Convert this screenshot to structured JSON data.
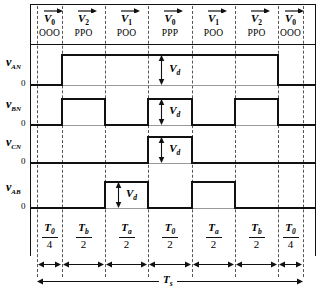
{
  "figure": {
    "zero_label": "0",
    "amplitude_label": "V",
    "amplitude_sub": "d",
    "total_label": "T",
    "total_sub": "s"
  },
  "segments": [
    {
      "vector": "V",
      "vector_sub": "0",
      "state": "OOO",
      "time_num": "T",
      "time_num_sub": "0",
      "time_den": "4"
    },
    {
      "vector": "V",
      "vector_sub": "2",
      "state": "PPO",
      "time_num": "T",
      "time_num_sub": "b",
      "time_den": "2"
    },
    {
      "vector": "V",
      "vector_sub": "1",
      "state": "POO",
      "time_num": "T",
      "time_num_sub": "a",
      "time_den": "2"
    },
    {
      "vector": "V",
      "vector_sub": "0",
      "state": "PPP",
      "time_num": "T",
      "time_num_sub": "0",
      "time_den": "2"
    },
    {
      "vector": "V",
      "vector_sub": "1",
      "state": "POO",
      "time_num": "T",
      "time_num_sub": "a",
      "time_den": "2"
    },
    {
      "vector": "V",
      "vector_sub": "2",
      "state": "PPO",
      "time_num": "T",
      "time_num_sub": "b",
      "time_den": "2"
    },
    {
      "vector": "V",
      "vector_sub": "0",
      "state": "OOO",
      "time_num": "T",
      "time_num_sub": "0",
      "time_den": "4"
    }
  ],
  "waveforms": [
    {
      "name": "v",
      "sub": "AN",
      "zero": "0",
      "levels": [
        0,
        1,
        1,
        1,
        1,
        1,
        0
      ],
      "vd_segment": 3,
      "vd_label": "V",
      "vd_sub": "d"
    },
    {
      "name": "v",
      "sub": "BN",
      "zero": "0",
      "levels": [
        0,
        1,
        0,
        1,
        0,
        1,
        0
      ],
      "vd_segment": 3,
      "vd_label": "V",
      "vd_sub": "d"
    },
    {
      "name": "v",
      "sub": "CN",
      "zero": "0",
      "levels": [
        0,
        0,
        0,
        1,
        0,
        0,
        0
      ],
      "vd_segment": 3,
      "vd_label": "V",
      "vd_sub": "d"
    },
    {
      "name": "v",
      "sub": "AB",
      "zero": "0",
      "levels": [
        0,
        0,
        1,
        0,
        1,
        0,
        0
      ],
      "vd_segment": 2,
      "vd_label": "V",
      "vd_sub": "d"
    }
  ],
  "chart_data": {
    "type": "line",
    "xlabel": "time",
    "ylabel": "pole / line voltages",
    "grid": false,
    "legend": "none",
    "x_boundaries_px": [
      37,
      62,
      105,
      148,
      192,
      235,
      278,
      303
    ],
    "categories": [
      "OOO",
      "PPO",
      "POO",
      "PPP",
      "POO",
      "PPO",
      "OOO"
    ],
    "vectors": [
      "V0",
      "V2",
      "V1",
      "V0",
      "V1",
      "V2",
      "V0"
    ],
    "durations": [
      "T0/4",
      "Tb/2",
      "Ta/2",
      "T0/2",
      "Ta/2",
      "Tb/2",
      "T0/4"
    ],
    "total_period": "Ts",
    "amplitude": "Vd",
    "series": [
      {
        "name": "vAN",
        "values": [
          0,
          1,
          1,
          1,
          1,
          1,
          0
        ]
      },
      {
        "name": "vBN",
        "values": [
          0,
          1,
          0,
          1,
          0,
          1,
          0
        ]
      },
      {
        "name": "vCN",
        "values": [
          0,
          0,
          0,
          1,
          0,
          0,
          0
        ]
      },
      {
        "name": "vAB",
        "values": [
          0,
          0,
          1,
          0,
          1,
          0,
          0
        ]
      }
    ],
    "ylim": [
      0,
      1
    ]
  }
}
